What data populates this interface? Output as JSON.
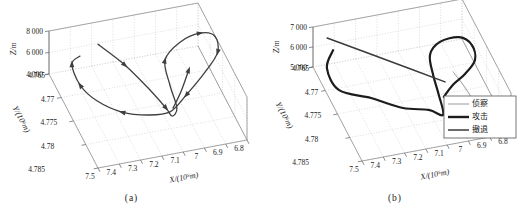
{
  "figure": {
    "captions": {
      "a": "(a)",
      "b": "(b)"
    },
    "colors": {
      "background": "#ffffff",
      "grid": "#c7c7c7",
      "box_edge": "#8f8f8f",
      "text": "#1b1b1b",
      "trajectory": "#3f3f3f",
      "attack": "#1c1c1c",
      "recon": "#9a9a9a",
      "retreat": "#3a3a3a"
    }
  },
  "chart_data": [
    {
      "panel": "a",
      "type": "line",
      "subtype": "trajectory-3d",
      "xlabel": "X/(10⁵m)",
      "ylabel": "Y/(10⁶m)",
      "zlabel": "Z/m",
      "xlim": [
        6.8,
        7.5
      ],
      "ylim": [
        4.765,
        4.785
      ],
      "zlim": [
        4000,
        8000
      ],
      "xtick_values": [
        7.5,
        7.4,
        7.3,
        7.2,
        7.1,
        7.0,
        6.9,
        6.8
      ],
      "xtick_labels": [
        "7.5",
        "7.4",
        "7.3",
        "7.2",
        "7.1",
        "7",
        "6.9",
        "6.8"
      ],
      "ytick_values": [
        4.765,
        4.77,
        4.775,
        4.78,
        4.785
      ],
      "ytick_labels": [
        "4.765",
        "4.77",
        "4.775",
        "4.78",
        "4.785"
      ],
      "ztick_values": [
        4000,
        6000,
        8000
      ],
      "ztick_labels": [
        "4 000",
        "6 000",
        "8 000"
      ],
      "grid": true,
      "legend": null,
      "series": [
        {
          "name": "trajectory",
          "color_key": "trajectory",
          "width": 1.3,
          "arrow_at": [
            1,
            3,
            7,
            9,
            11,
            13,
            16,
            18,
            19
          ],
          "points": [
            [
              7.303,
              4.7679,
              7300
            ],
            [
              7.222,
              4.7719,
              6800
            ],
            [
              7.151,
              4.776,
              6000
            ],
            [
              7.104,
              4.7784,
              5200
            ],
            [
              7.084,
              4.7791,
              4700
            ],
            [
              7.05,
              4.7781,
              4900
            ],
            [
              7.055,
              4.7757,
              6000
            ],
            [
              7.045,
              4.7728,
              7000
            ],
            [
              6.955,
              4.7711,
              7600
            ],
            [
              6.851,
              4.7703,
              7700
            ],
            [
              6.79,
              4.771,
              7500
            ],
            [
              6.8,
              4.773,
              6900
            ],
            [
              6.881,
              4.7749,
              6200
            ],
            [
              6.994,
              4.777,
              5400
            ],
            [
              7.086,
              4.7784,
              4800
            ],
            [
              7.182,
              4.7778,
              4600
            ],
            [
              7.287,
              4.7763,
              4600
            ],
            [
              7.374,
              4.7736,
              4800
            ],
            [
              7.43,
              4.7716,
              5600
            ],
            [
              7.442,
              4.7693,
              6600
            ],
            [
              7.397,
              4.7687,
              6900
            ]
          ]
        },
        {
          "name": "trajectory-final-climb",
          "color_key": "trajectory",
          "width": 1.3,
          "arrow_at": [
            2
          ],
          "points": [
            [
              7.067,
              4.778,
              4900
            ],
            [
              7.016,
              4.7768,
              5700
            ],
            [
              6.955,
              4.7747,
              6600
            ]
          ]
        }
      ]
    },
    {
      "panel": "b",
      "type": "line",
      "subtype": "trajectory-3d",
      "xlabel": "X/(10⁵m)",
      "ylabel": "Y/(10⁶m)",
      "zlabel": "Z/m",
      "xlim": [
        6.8,
        7.5
      ],
      "ylim": [
        4.765,
        4.785
      ],
      "zlim": [
        5000,
        7000
      ],
      "xtick_values": [
        7.5,
        7.4,
        7.3,
        7.2,
        7.1,
        7.0,
        6.9,
        6.8
      ],
      "xtick_labels": [
        "7.5",
        "7.4",
        "7.3",
        "7.2",
        "7.1",
        "7",
        "6.9",
        "6.8"
      ],
      "ytick_values": [
        4.765,
        4.77,
        4.775,
        4.78,
        4.785
      ],
      "ytick_labels": [
        "4.765",
        "4.77",
        "4.775",
        "4.78",
        "4.785"
      ],
      "ztick_values": [
        5000,
        6000,
        7000
      ],
      "ztick_labels": [
        "5 000",
        "6 000",
        "7 000"
      ],
      "grid": true,
      "legend": {
        "position": "right-middle",
        "entries": [
          {
            "label": "侦察",
            "color_key": "recon",
            "width": 1.0
          },
          {
            "label": "攻击",
            "color_key": "attack",
            "width": 2.4
          },
          {
            "label": "撤退",
            "color_key": "retreat",
            "width": 1.5
          }
        ]
      },
      "series": [
        {
          "name": "侦察",
          "color_key": "recon",
          "width": 1.0,
          "arrow_at": [],
          "points": [
            [
              6.894,
              4.7785,
              5150
            ],
            [
              6.923,
              4.7765,
              5600
            ],
            [
              6.961,
              4.7753,
              6100
            ]
          ]
        },
        {
          "name": "攻击",
          "color_key": "attack",
          "width": 2.2,
          "arrow_at": [],
          "points": [
            [
              7.439,
              4.7679,
              6400
            ],
            [
              7.483,
              4.7692,
              5900
            ],
            [
              7.458,
              4.772,
              5400
            ],
            [
              7.332,
              4.7741,
              5250
            ],
            [
              7.213,
              4.7768,
              5150
            ],
            [
              7.109,
              4.7783,
              5200
            ],
            [
              7.055,
              4.7794,
              5100
            ],
            [
              7.055,
              4.7777,
              5700
            ],
            [
              7.062,
              4.776,
              6300
            ],
            [
              7.053,
              4.7739,
              6800
            ],
            [
              6.99,
              4.7725,
              7000
            ],
            [
              6.895,
              4.7721,
              6950
            ],
            [
              6.847,
              4.7731,
              6700
            ],
            [
              6.845,
              4.7742,
              6200
            ],
            [
              6.901,
              4.775,
              5800
            ],
            [
              6.964,
              4.7755,
              5500
            ],
            [
              7.02,
              4.7767,
              5300
            ]
          ]
        },
        {
          "name": "撤退",
          "color_key": "retreat",
          "width": 1.5,
          "arrow_at": [],
          "points": [
            [
              7.442,
              4.7657,
              6500
            ],
            [
              7.226,
              4.7709,
              6200
            ],
            [
              7.004,
              4.7758,
              5800
            ]
          ]
        }
      ]
    }
  ]
}
